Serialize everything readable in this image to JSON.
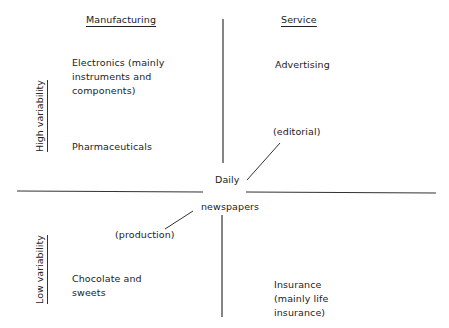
{
  "diagram": {
    "column_headers": {
      "left": "Manufacturing",
      "right": "Service"
    },
    "row_headers": {
      "top": "High variability",
      "bottom": "Low variability"
    },
    "quadrants": {
      "top_left": [
        "Electronics (mainly",
        "instruments and",
        "components)"
      ],
      "top_left_2": "Pharmaceuticals",
      "top_right": "Advertising",
      "bottom_left": [
        "Chocolate and",
        "sweets"
      ],
      "bottom_right": [
        "Insurance",
        "(mainly life",
        "insurance)"
      ]
    },
    "center": {
      "line1": "Daily",
      "line2": "newspapers"
    },
    "annotations": {
      "editorial": "(editorial)",
      "production": "(production)"
    },
    "colors": {
      "line": "#333333",
      "text": "#222222"
    }
  }
}
